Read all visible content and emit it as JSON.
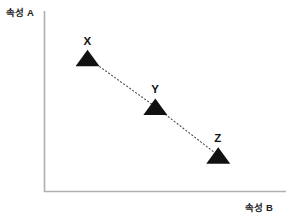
{
  "figure": {
    "background_color": "#ffffff",
    "axis_color": "#b0b0b0",
    "marker_color": "#111111",
    "connector_color": "#4a4a4a"
  },
  "axes": {
    "y_label": "속성 A",
    "x_label": "속성 B"
  },
  "points": {
    "X": {
      "label": "X"
    },
    "Y": {
      "label": "Y"
    },
    "Z": {
      "label": "Z"
    }
  },
  "chart_data": {
    "type": "scatter",
    "title": "",
    "subtitle": "",
    "xlabel": "속성 B",
    "ylabel": "속성 A",
    "xlim": [
      0,
      10
    ],
    "ylim": [
      0,
      10
    ],
    "grid": false,
    "legend": false,
    "axis_ticks": false,
    "marker": "triangle-up",
    "marker_color": "#111111",
    "connector": "dotted line connecting X to Y to Z",
    "trend": "negative (decreasing)",
    "categories": [
      "X",
      "Y",
      "Z"
    ],
    "series": [
      {
        "name": "속성 A vs 속성 B",
        "points": [
          {
            "label": "X",
            "x": 1.8,
            "y": 7.4
          },
          {
            "label": "Y",
            "x": 4.6,
            "y": 4.7
          },
          {
            "label": "Z",
            "x": 7.2,
            "y": 2.0
          }
        ]
      }
    ],
    "x": [
      1.8,
      4.6,
      7.2
    ],
    "values": [
      7.4,
      4.7,
      2.0
    ],
    "data_labels": [
      "X",
      "Y",
      "Z"
    ]
  }
}
